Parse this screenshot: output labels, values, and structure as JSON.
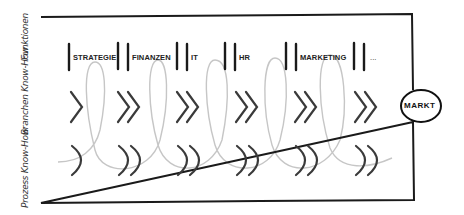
{
  "rows": {
    "functions": "Funktionen",
    "industry": "Branchen Know-How",
    "process": "Prozess Know-How"
  },
  "functions": [
    "STRATEGIE",
    "FINANZEN",
    "IT",
    "HR",
    "MARKETING",
    "..."
  ],
  "market": "MARKT",
  "colors": {
    "ink": "#1a1a1a",
    "symbol": "#3a3a3a",
    "curve": "#c8c8c8"
  }
}
